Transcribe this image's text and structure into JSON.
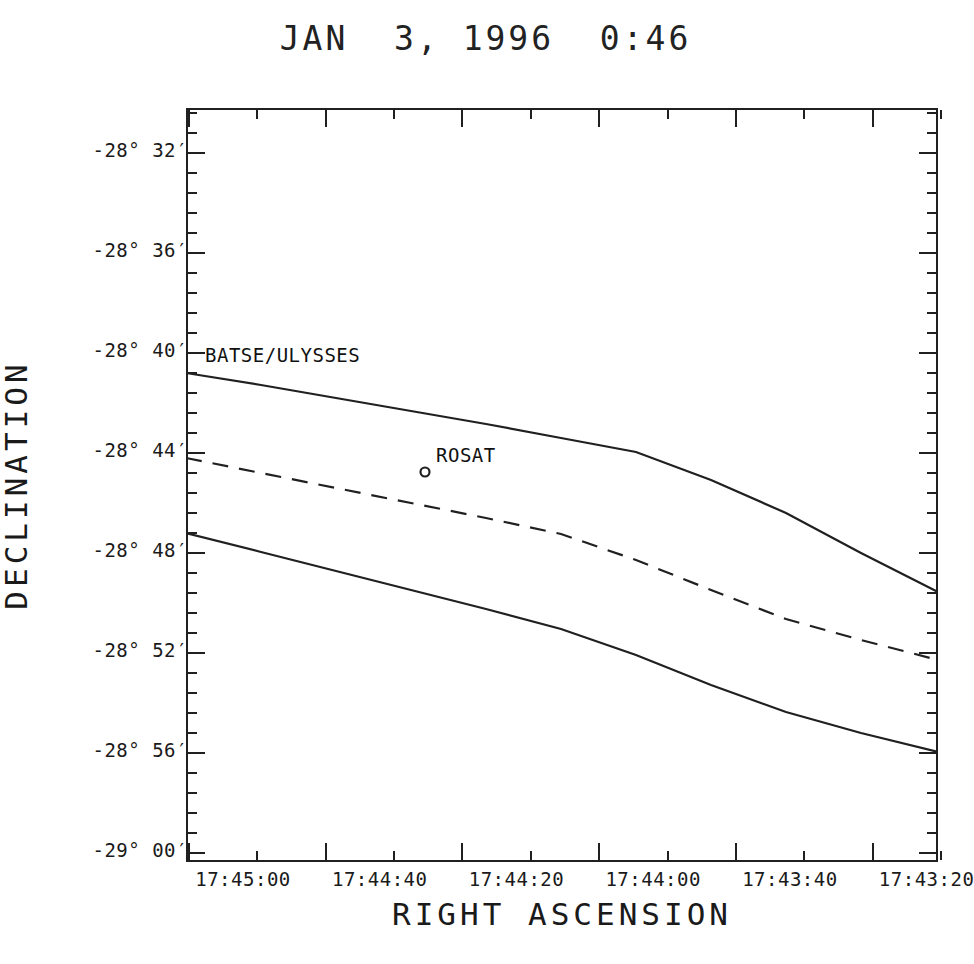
{
  "chart_data": {
    "type": "line",
    "title": "JAN  3, 1996  0:46",
    "xlabel": "RIGHT ASCENSION",
    "ylabel": "DECLINATION",
    "grid": false,
    "legend": "none",
    "xlim": [
      "17:45:10",
      "17:43:15"
    ],
    "ylim": [
      "-29 00'",
      "-28 30'"
    ],
    "x_tick_labels": [
      "17:45:00",
      "17:44:40",
      "17:44:20",
      "17:44:00",
      "17:43:40",
      "17:43:20"
    ],
    "y_tick_labels": [
      "-28° 32′",
      "-28° 36′",
      "-28° 40′",
      "-28° 44′",
      "-28° 48′",
      "-28° 52′",
      "-28° 56′",
      "-29° 00′"
    ],
    "series": [
      {
        "name": "BATSE/ULYSSES upper bound",
        "style": "solid",
        "points_px": [
          [
            186,
            373
          ],
          [
            261,
            385
          ],
          [
            336,
            398
          ],
          [
            411,
            411
          ],
          [
            486,
            424
          ],
          [
            561,
            438
          ],
          [
            636,
            452
          ],
          [
            711,
            480
          ],
          [
            786,
            513
          ],
          [
            861,
            553
          ],
          [
            938,
            592
          ]
        ]
      },
      {
        "name": "BATSE/ULYSSES centre line",
        "style": "dashed",
        "points_px": [
          [
            186,
            458
          ],
          [
            261,
            473
          ],
          [
            336,
            488
          ],
          [
            411,
            503
          ],
          [
            486,
            518
          ],
          [
            561,
            534
          ],
          [
            636,
            560
          ],
          [
            711,
            590
          ],
          [
            786,
            619
          ],
          [
            861,
            640
          ],
          [
            938,
            660
          ]
        ]
      },
      {
        "name": "BATSE/ULYSSES lower bound",
        "style": "solid",
        "points_px": [
          [
            186,
            533
          ],
          [
            261,
            552
          ],
          [
            336,
            571
          ],
          [
            411,
            590
          ],
          [
            486,
            609
          ],
          [
            561,
            629
          ],
          [
            636,
            655
          ],
          [
            711,
            685
          ],
          [
            786,
            712
          ],
          [
            861,
            733
          ],
          [
            938,
            752
          ]
        ]
      }
    ],
    "markers": [
      {
        "name": "ROSAT",
        "shape": "circle",
        "x_px": 425,
        "y_px": 472
      }
    ],
    "annotations": [
      {
        "name": "batse-ulysses-label",
        "text": "BATSE/ULYSSES",
        "x_px": 205,
        "y_px": 344
      },
      {
        "name": "rosat-label",
        "text": "ROSAT",
        "x_px": 436,
        "y_px": 444
      }
    ],
    "colors": {
      "line": "#202020",
      "axis": "#202020",
      "text": "#1a1a1a",
      "background": "#ffffff"
    }
  }
}
